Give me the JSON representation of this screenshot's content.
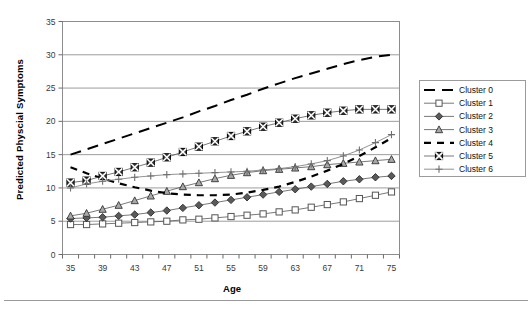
{
  "figure": {
    "y_axis_title": "Predicted Physcial Symptoms",
    "x_axis_title": "Age"
  },
  "legend": {
    "items": [
      {
        "label": "Cluster 0",
        "marker": "none",
        "dash": "long-dash",
        "color": "#000000",
        "width": 2.0
      },
      {
        "label": "Cluster 1",
        "marker": "open-square",
        "dash": "solid",
        "color": "#555555",
        "width": 0.8
      },
      {
        "label": "Cluster 2",
        "marker": "filled-diamond",
        "dash": "solid",
        "color": "#555555",
        "width": 0.8
      },
      {
        "label": "Cluster 3",
        "marker": "open-triangle",
        "dash": "solid",
        "color": "#555555",
        "width": 0.8
      },
      {
        "label": "Cluster 4",
        "marker": "none",
        "dash": "short-dash",
        "color": "#000000",
        "width": 2.2
      },
      {
        "label": "Cluster 5",
        "marker": "square-x",
        "dash": "solid",
        "color": "#555555",
        "width": 0.8
      },
      {
        "label": "Cluster 6",
        "marker": "plus",
        "dash": "solid",
        "color": "#777777",
        "width": 0.8
      }
    ]
  },
  "chart_data": {
    "type": "line",
    "title": "",
    "xlabel": "Age",
    "ylabel": "Predicted Physcial Symptoms",
    "xlim": [
      34,
      76
    ],
    "ylim": [
      0,
      35
    ],
    "ytick_step": 5,
    "yticks": [
      0,
      5,
      10,
      15,
      20,
      25,
      30,
      35
    ],
    "xtick_step": 2,
    "xticks": [
      34,
      36,
      38,
      40,
      42,
      44,
      46,
      48,
      50,
      52,
      54,
      56,
      58,
      60,
      62,
      64,
      66,
      68,
      70,
      72,
      74,
      76
    ],
    "xtick_labels": [
      35,
      39,
      43,
      47,
      51,
      55,
      59,
      63,
      67,
      71,
      75
    ],
    "grid": "horizontal",
    "legend_position": "right",
    "x": [
      35,
      37,
      39,
      41,
      43,
      45,
      47,
      49,
      51,
      53,
      55,
      57,
      59,
      61,
      63,
      65,
      67,
      69,
      71,
      73,
      75
    ],
    "series": [
      {
        "name": "Cluster 0",
        "values": [
          15.0,
          15.8,
          16.6,
          17.4,
          18.2,
          19.0,
          19.8,
          20.6,
          21.5,
          22.3,
          23.2,
          24.0,
          24.9,
          25.7,
          26.5,
          27.2,
          27.9,
          28.6,
          29.2,
          29.7,
          30.0
        ]
      },
      {
        "name": "Cluster 1",
        "values": [
          4.5,
          4.5,
          4.6,
          4.7,
          4.8,
          4.9,
          5.0,
          5.2,
          5.3,
          5.5,
          5.7,
          5.9,
          6.1,
          6.4,
          6.7,
          7.1,
          7.5,
          7.9,
          8.4,
          8.9,
          9.4
        ]
      },
      {
        "name": "Cluster 2",
        "values": [
          5.4,
          5.5,
          5.6,
          5.8,
          6.0,
          6.3,
          6.6,
          7.0,
          7.4,
          7.8,
          8.2,
          8.6,
          9.0,
          9.4,
          9.8,
          10.2,
          10.6,
          11.0,
          11.3,
          11.6,
          11.8
        ]
      },
      {
        "name": "Cluster 3",
        "values": [
          5.8,
          6.2,
          6.8,
          7.4,
          8.1,
          8.8,
          9.5,
          10.2,
          10.8,
          11.4,
          11.9,
          12.3,
          12.6,
          12.8,
          13.0,
          13.2,
          13.5,
          13.7,
          13.9,
          14.1,
          14.3
        ]
      },
      {
        "name": "Cluster 4",
        "values": [
          13.1,
          12.2,
          11.4,
          10.7,
          10.1,
          9.6,
          9.2,
          9.0,
          8.9,
          8.9,
          9.0,
          9.3,
          9.7,
          10.2,
          10.9,
          11.7,
          12.6,
          13.6,
          14.8,
          16.1,
          17.5
        ]
      },
      {
        "name": "Cluster 5",
        "values": [
          10.8,
          11.1,
          11.8,
          12.4,
          13.1,
          13.8,
          14.6,
          15.4,
          16.2,
          17.0,
          17.8,
          18.5,
          19.2,
          19.8,
          20.4,
          20.9,
          21.3,
          21.6,
          21.8,
          21.8,
          21.8
        ]
      },
      {
        "name": "Cluster 6",
        "values": [
          10.0,
          10.6,
          11.0,
          11.3,
          11.6,
          11.8,
          12.0,
          12.1,
          12.2,
          12.3,
          12.4,
          12.5,
          12.7,
          12.9,
          13.2,
          13.6,
          14.1,
          14.8,
          15.7,
          16.8,
          18.0
        ]
      }
    ]
  }
}
